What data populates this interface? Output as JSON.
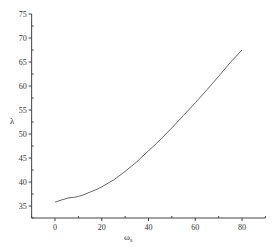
{
  "chart_data": {
    "type": "line",
    "title": "",
    "xlabel": "ω",
    "xlabel_subscript": "s",
    "ylabel": "λ",
    "xlim": [
      -10,
      90
    ],
    "ylim": [
      32.5,
      75
    ],
    "grid": false,
    "legend": null,
    "x_ticks": [
      0,
      20,
      40,
      60,
      80
    ],
    "x_tick_labels": [
      "0",
      "20",
      "40",
      "60",
      "80"
    ],
    "x_minor_ticks": [
      -10,
      10,
      30,
      50,
      70,
      90
    ],
    "y_ticks": [
      35,
      40,
      45,
      50,
      55,
      60,
      65,
      70,
      75
    ],
    "y_tick_labels": [
      "35",
      "40",
      "45",
      "50",
      "55",
      "60",
      "65",
      "70",
      "75"
    ],
    "y_minor_step": 2.5,
    "series": [
      {
        "name": "λ",
        "color": "#666666",
        "x": [
          0,
          3,
          6,
          8,
          10,
          12,
          15,
          18,
          20,
          25,
          30,
          35,
          40,
          45,
          50,
          55,
          60,
          65,
          70,
          75,
          80
        ],
        "y": [
          35.8,
          36.3,
          36.7,
          36.8,
          37.0,
          37.3,
          37.9,
          38.5,
          39.0,
          40.4,
          42.2,
          44.2,
          46.5,
          48.8,
          51.3,
          53.9,
          56.5,
          59.2,
          62.0,
          64.9,
          67.5
        ]
      }
    ]
  }
}
